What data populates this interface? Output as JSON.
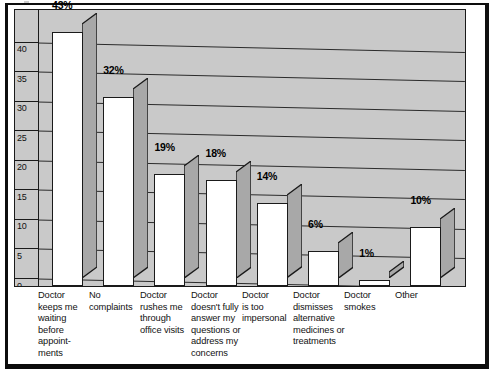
{
  "chart_data": {
    "type": "bar",
    "title": "",
    "subtitle": "",
    "xlabel": "",
    "ylabel": "",
    "ylim": [
      0,
      43
    ],
    "yticks": [
      "0",
      "5",
      "10",
      "15",
      "20",
      "25",
      "30",
      "35",
      "40"
    ],
    "grid": true,
    "legend": false,
    "style": "3d-bar",
    "categories": [
      "Doctor keeps me waiting before appoint-ments",
      "No complaints",
      "Doctor rushes me through office visits",
      "Doctor doesn't fully answer my questions or address my concerns",
      "Doctor is too impersonal",
      "Doctor dismisses alternative medicines or treatments",
      "Doctor smokes",
      "Other"
    ],
    "category_lines": [
      [
        "Doctor",
        "keeps me",
        "waiting",
        "before",
        "appoint-",
        "ments"
      ],
      [
        "No",
        "complaints"
      ],
      [
        "Doctor",
        "rushes me",
        "through",
        "office visits"
      ],
      [
        "Doctor",
        "doesn't fully",
        "answer my",
        "questions or",
        "address my",
        "concerns"
      ],
      [
        "Doctor",
        "is too",
        "impersonal"
      ],
      [
        "Doctor",
        "dismisses",
        "alternative",
        "medicines or",
        "treatments"
      ],
      [
        "Doctor",
        "smokes"
      ],
      [
        "Other"
      ]
    ],
    "values": [
      43,
      32,
      19,
      18,
      14,
      6,
      1,
      10
    ],
    "value_labels": [
      "43%",
      "32%",
      "19%",
      "18%",
      "14%",
      "6%",
      "1%",
      "10%"
    ],
    "colors": {
      "bar_face": "#ffffff",
      "bar_side": "#a8a8a8",
      "plot_background": "#c9c9c9",
      "gridline": "#2b2b2b",
      "outline": "#1a1a1a",
      "page_background": "#ffffff",
      "frame": "#0d0d0d"
    }
  }
}
